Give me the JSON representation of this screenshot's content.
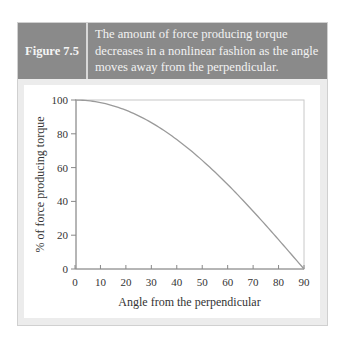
{
  "figure": {
    "label": "Figure 7.5",
    "caption": "The amount of force producing torque decreases in a nonlinear fashion as the angle moves away from the perpendicular."
  },
  "colors": {
    "header_bg": "#8a8a8a",
    "panel_bg": "#ececec",
    "line": "#9a9a9a",
    "axis": "#888888"
  },
  "chart_data": {
    "type": "line",
    "title": "",
    "xlabel": "Angle from the perpendicular",
    "ylabel": "% of force producing torque",
    "x_ticks": [
      0,
      10,
      20,
      30,
      40,
      50,
      60,
      70,
      80,
      90
    ],
    "y_ticks": [
      0,
      20,
      40,
      60,
      80,
      100
    ],
    "xlim": [
      0,
      90
    ],
    "ylim": [
      0,
      100
    ],
    "grid": false,
    "legend": null,
    "series": [
      {
        "name": "% of force producing torque",
        "x": [
          0,
          10,
          20,
          30,
          40,
          50,
          60,
          70,
          80,
          90
        ],
        "y": [
          100,
          98.5,
          94,
          86.6,
          76.6,
          64.3,
          50,
          34.2,
          17.4,
          0
        ]
      }
    ]
  }
}
